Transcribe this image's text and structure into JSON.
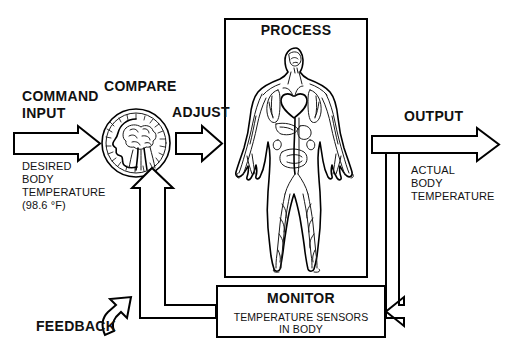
{
  "diagram": {
    "background_color": "#ffffff",
    "line_color": "#000000"
  },
  "labels": {
    "command_input": "COMMAND\nINPUT",
    "command_input_detail": "DESIRED\nBODY\nTEMPERATURE\n(98.6 °F)",
    "compare": "COMPARE",
    "adjust": "ADJUST",
    "process": "PROCESS",
    "output": "OUTPUT",
    "output_detail": "ACTUAL\nBODY\nTEMPERATURE",
    "monitor": "MONITOR",
    "monitor_detail": "TEMPERATURE SENSORS\nIN BODY",
    "feedback": "FEEDBACK"
  },
  "blocks": [
    {
      "id": "process",
      "title": "PROCESS",
      "icon": "human-body-circulatory-figure"
    },
    {
      "id": "monitor",
      "title": "MONITOR",
      "detail": "TEMPERATURE SENSORS IN BODY"
    },
    {
      "id": "compare",
      "title": "COMPARE",
      "icon": "head-brain-spinal-cord-circle"
    }
  ],
  "connectors": [
    {
      "id": "command-input-arrow",
      "label": "COMMAND INPUT",
      "direction": "right"
    },
    {
      "id": "adjust-arrow",
      "label": "ADJUST",
      "direction": "right"
    },
    {
      "id": "output-arrow",
      "label": "OUTPUT",
      "direction": "right"
    },
    {
      "id": "output-branch-to-monitor",
      "label": "",
      "direction": "down-left"
    },
    {
      "id": "feedback-line-to-compare",
      "label": "",
      "direction": "left-up"
    },
    {
      "id": "feedback-curved-arrow",
      "label": "FEEDBACK",
      "direction": "up-left"
    }
  ]
}
